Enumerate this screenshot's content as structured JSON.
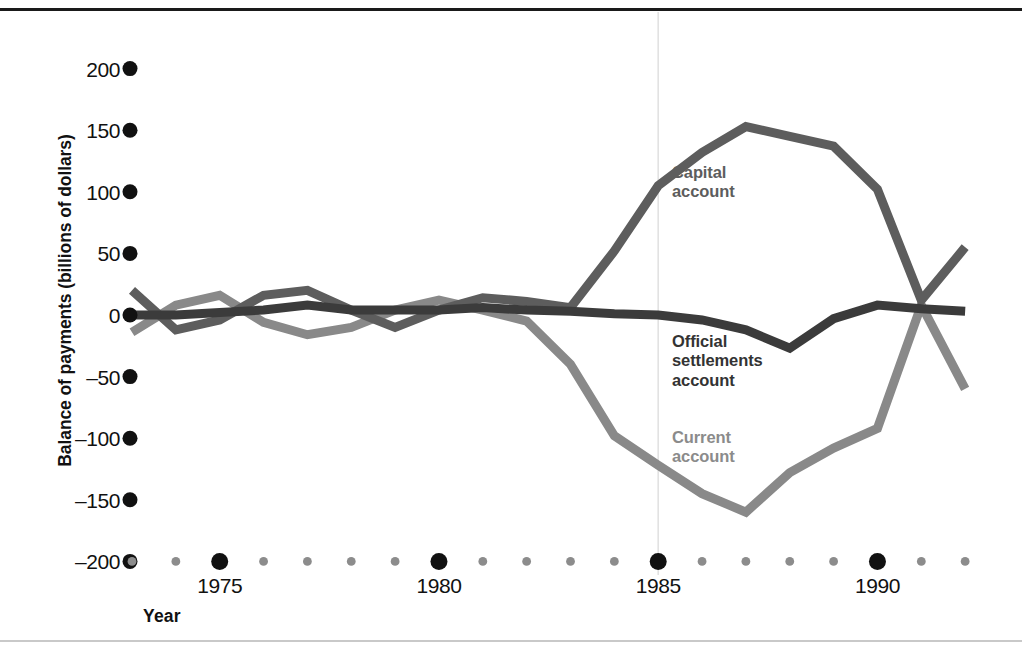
{
  "figure": {
    "background": "#ffffff",
    "top_rule_color": "#1a1a1a",
    "bottom_rule_color": "#c9c9c9"
  },
  "axes": {
    "y_title": "Balance of payments (billions of dollars)",
    "x_title": "Year",
    "y_tick_labels": [
      "200",
      "150",
      "100",
      "50",
      "0",
      "–50",
      "–100",
      "–150",
      "–200"
    ],
    "y_tick_values": [
      200,
      150,
      100,
      50,
      0,
      -50,
      -100,
      -150,
      -200
    ],
    "x_major_tick_labels": [
      "1975",
      "1980",
      "1985",
      "1990"
    ],
    "x_major_tick_values": [
      1975,
      1980,
      1985,
      1990
    ],
    "x_minor_tick_values": [
      1973,
      1974,
      1976,
      1977,
      1978,
      1979,
      1981,
      1982,
      1983,
      1984,
      1986,
      1987,
      1988,
      1989,
      1991,
      1992
    ],
    "tick_marker_major_color": "#111111",
    "tick_marker_minor_color": "#8c8c8c",
    "gridline_color": "#e2e2e2",
    "gridline_year": 1985,
    "zero_line_color": "#3b3b3b"
  },
  "series_labels": {
    "capital": "Capital\naccount",
    "official": "Official\nsettlements\naccount",
    "current": "Current\naccount"
  },
  "chart_data": {
    "type": "line",
    "title": "",
    "subtitle": "",
    "xlabel": "Year",
    "ylabel": "Balance of payments (billions of dollars)",
    "xlim": [
      1973,
      1992
    ],
    "ylim": [
      -200,
      200
    ],
    "grid": "single vertical gridline at 1985",
    "legend": "inline annotations next to each line",
    "x": [
      1973,
      1974,
      1975,
      1976,
      1977,
      1978,
      1979,
      1980,
      1981,
      1982,
      1983,
      1984,
      1985,
      1986,
      1987,
      1988,
      1989,
      1990,
      1991,
      1992
    ],
    "series": [
      {
        "name": "Capital account",
        "color": "#5d5d5d",
        "label_color": "#5d5d5d",
        "values": [
          20,
          -12,
          -4,
          16,
          20,
          4,
          -10,
          4,
          14,
          11,
          6,
          52,
          105,
          132,
          153,
          145,
          137,
          102,
          12,
          55
        ]
      },
      {
        "name": "Current account",
        "color": "#898989",
        "label_color": "#8b8b8b",
        "values": [
          -14,
          8,
          16,
          -6,
          -16,
          -10,
          4,
          12,
          4,
          -5,
          -40,
          -98,
          -122,
          -145,
          -160,
          -128,
          -108,
          -92,
          8,
          -60
        ]
      },
      {
        "name": "Official settlements account",
        "color": "#3b3b3b",
        "label_color": "#333333",
        "values": [
          0,
          0,
          2,
          4,
          8,
          4,
          4,
          4,
          6,
          4,
          3,
          1,
          0,
          -4,
          -12,
          -27,
          -3,
          8,
          5,
          3
        ]
      }
    ]
  },
  "geometry": {
    "x_1973_px": 132,
    "x_per_year_px": 43.85,
    "y_zero_px": 315,
    "y_per_unit_px": 1.232,
    "line_width_px": 9
  }
}
